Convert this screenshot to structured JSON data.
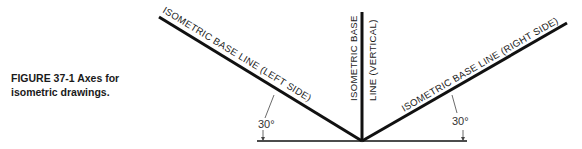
{
  "figure": {
    "caption_line1": "FIGURE 37-1  Axes for",
    "caption_line2": "isometric drawings."
  },
  "labels": {
    "left_axis": "ISOMETRIC BASE LINE (LEFT SIDE)",
    "vertical_axis_line1": "ISOMETRIC BASE",
    "vertical_axis_line2": "LINE (VERTICAL)",
    "right_axis": "ISOMETRIC BASE LINE (RIGHT SIDE)",
    "left_angle": "30°",
    "right_angle": "30°"
  },
  "colors": {
    "line": "#111111",
    "text": "#1a1a1a"
  }
}
